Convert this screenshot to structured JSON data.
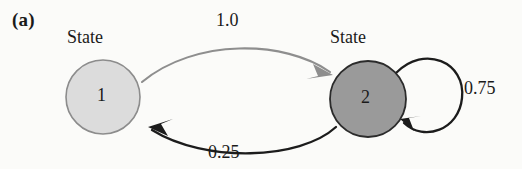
{
  "figure": {
    "panel_label": "(a)",
    "type": "state-transition-diagram"
  },
  "states": [
    {
      "id": "state1",
      "caption": "State",
      "number": "1",
      "fill": "#dcdcdc",
      "stroke": "#8c8c8c",
      "cx": 103,
      "cy": 97,
      "r": 37
    },
    {
      "id": "state2",
      "caption": "State",
      "number": "2",
      "fill": "#9a9a9a",
      "stroke": "#2b2b2b",
      "cx": 368,
      "cy": 99,
      "r": 38
    }
  ],
  "transitions": [
    {
      "id": "t-1-to-2",
      "from": "1",
      "to": "2",
      "weight": "1.0",
      "color": "#8e8e8e"
    },
    {
      "id": "t-2-to-1",
      "from": "2",
      "to": "1",
      "weight": "0.25",
      "color": "#1c1c1c"
    },
    {
      "id": "t-2-to-2",
      "from": "2",
      "to": "2",
      "weight": "0.75",
      "color": "#1c1c1c"
    }
  ],
  "icons": {
    "arrowhead": "arrowhead-icon",
    "self_loop": "self-loop-icon"
  }
}
